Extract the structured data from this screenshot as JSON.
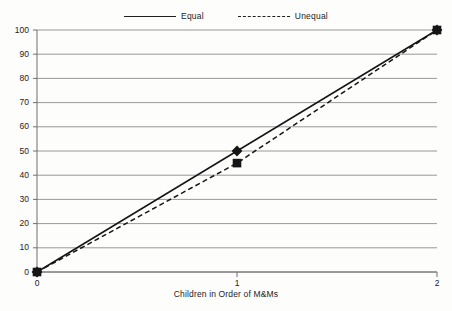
{
  "chart_data": {
    "type": "line",
    "title": "",
    "xlabel": "Children in Order of M&Ms",
    "ylabel": "",
    "x": [
      0,
      1,
      2
    ],
    "xtick_labels": [
      "0",
      "1",
      "2"
    ],
    "ytick_labels": [
      "0",
      "10",
      "20",
      "30",
      "40",
      "50",
      "60",
      "70",
      "80",
      "90",
      "100"
    ],
    "yticks": [
      0,
      10,
      20,
      30,
      40,
      50,
      60,
      70,
      80,
      90,
      100
    ],
    "ylim": [
      0,
      100
    ],
    "xlim": [
      0,
      2
    ],
    "grid": "horizontal",
    "legend_position": "top-center",
    "series": [
      {
        "name": "Equal",
        "values": [
          0,
          50,
          100
        ],
        "line_style": "solid",
        "marker": "diamond",
        "color": "#151515"
      },
      {
        "name": "Unequal",
        "values": [
          0,
          45,
          100
        ],
        "line_style": "dashed",
        "marker": "square",
        "color": "#151515"
      }
    ]
  },
  "legend": {
    "items": [
      {
        "label": "Equal",
        "marker_icon": "diamond-marker-icon",
        "line": "solid"
      },
      {
        "label": "Unequal",
        "marker_icon": "square-marker-icon",
        "line": "dashed"
      }
    ]
  },
  "axes": {
    "x_title": "Children in Order of M&Ms",
    "x_labels": [
      "0",
      "1",
      "2"
    ],
    "y_labels": [
      "100",
      "90",
      "80",
      "70",
      "60",
      "50",
      "40",
      "30",
      "20",
      "10",
      "0"
    ]
  },
  "colors": {
    "line": "#151515",
    "grid": "#8d8d8d",
    "axis": "#6e6e6e",
    "background": "#fdfdfc",
    "text": "#1c1c1c"
  }
}
